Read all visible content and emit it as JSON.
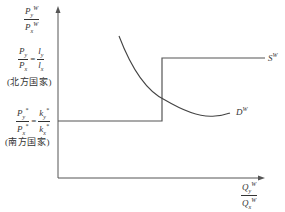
{
  "diagram": {
    "type": "economics-trade-supply-demand",
    "y_axis": {
      "label_num": "P",
      "label_num_sub": "y",
      "label_num_sup": "W",
      "label_den": "P",
      "label_den_sub": "x",
      "label_den_sup": "W"
    },
    "x_axis": {
      "label_num": "Q",
      "label_num_sub": "y",
      "label_num_sup": "W",
      "label_den": "Q",
      "label_den_sub": "x",
      "label_den_sup": "W"
    },
    "north": {
      "lhs_num": "P",
      "lhs_num_sub": "y",
      "lhs_den": "P",
      "lhs_den_sub": "x",
      "equals": "=",
      "rhs_num": "l",
      "rhs_num_sub": "y",
      "rhs_den": "l",
      "rhs_den_sub": "x",
      "country": "(北方国家)"
    },
    "south": {
      "lhs_num": "P",
      "lhs_num_sub": "y",
      "lhs_num_sup": "*",
      "lhs_den": "P",
      "lhs_den_sub": "x",
      "lhs_den_sup": "*",
      "equals": "=",
      "rhs_num": "k",
      "rhs_num_sub": "y",
      "rhs_num_sup": "*",
      "rhs_den": "k",
      "rhs_den_sub": "x",
      "rhs_den_sup": "*",
      "country": "(南方国家)"
    },
    "curves": {
      "supply": {
        "label": "S",
        "sup": "W"
      },
      "demand": {
        "label": "D",
        "sup": "W"
      }
    },
    "colors": {
      "line": "#444444",
      "text": "#333333",
      "background": "#ffffff"
    }
  }
}
